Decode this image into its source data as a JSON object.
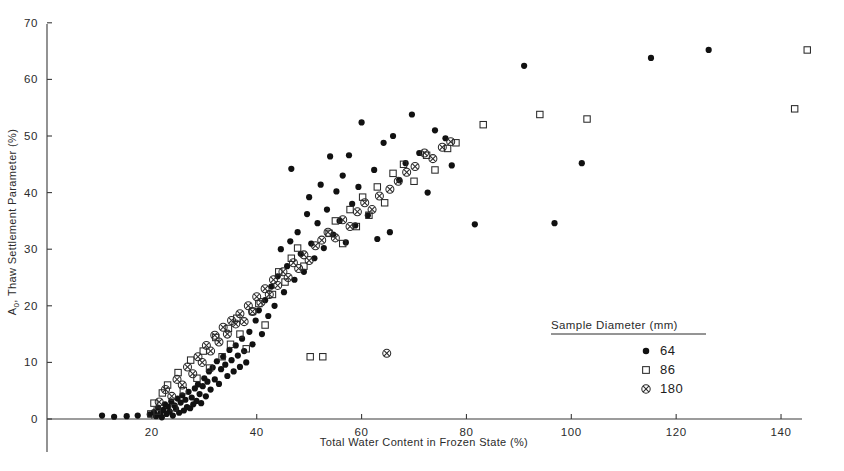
{
  "chart_data": {
    "type": "scatter",
    "title": "",
    "xlabel": "Total Water Content in Frozen State (%)",
    "ylabel": "A0, Thaw Settlement Parameter (%)",
    "ylabel_main": "A",
    "ylabel_sub": "0",
    "ylabel_rest": ", Thaw Settlement Parameter (%)",
    "xlim": [
      0,
      144
    ],
    "ylim": [
      0,
      70
    ],
    "xticks": [
      20,
      40,
      60,
      80,
      100,
      120,
      140
    ],
    "yticks": [
      0,
      10,
      20,
      30,
      40,
      50,
      60,
      70
    ],
    "xtick_labels": [
      "20",
      "40",
      "60",
      "80",
      "100",
      "120",
      "140"
    ],
    "ytick_labels": [
      "0",
      "10",
      "20",
      "30",
      "40",
      "50",
      "60",
      "70"
    ],
    "grid": false,
    "legend_position": "bottom-right",
    "legend": {
      "title": "Sample Diameter (mm)",
      "entries": [
        {
          "label": "64",
          "marker": "filled-circle"
        },
        {
          "label": "86",
          "marker": "open-square"
        },
        {
          "label": "180",
          "marker": "circled-cross"
        }
      ]
    },
    "series": [
      {
        "name": "64",
        "marker": "filled-circle",
        "color": "#111111",
        "points": [
          [
            10.5,
            0.6
          ],
          [
            12.8,
            0.4
          ],
          [
            15.2,
            0.5
          ],
          [
            17.3,
            0.6
          ],
          [
            19.6,
            0.8
          ],
          [
            20.4,
            1.2
          ],
          [
            20.8,
            0.5
          ],
          [
            21.2,
            2.0
          ],
          [
            21.6,
            1.0
          ],
          [
            21.9,
            0.3
          ],
          [
            22.2,
            1.6
          ],
          [
            22.5,
            2.6
          ],
          [
            22.8,
            0.9
          ],
          [
            23.1,
            2.2
          ],
          [
            23.4,
            1.3
          ],
          [
            23.7,
            3.1
          ],
          [
            24.0,
            0.6
          ],
          [
            24.3,
            2.4
          ],
          [
            24.6,
            1.8
          ],
          [
            24.9,
            3.6
          ],
          [
            25.2,
            1.1
          ],
          [
            25.5,
            2.9
          ],
          [
            25.8,
            4.2
          ],
          [
            26.1,
            1.5
          ],
          [
            26.4,
            3.4
          ],
          [
            26.7,
            2.1
          ],
          [
            27.0,
            4.8
          ],
          [
            27.3,
            1.9
          ],
          [
            27.6,
            3.8
          ],
          [
            27.9,
            2.6
          ],
          [
            28.2,
            5.4
          ],
          [
            28.5,
            3.2
          ],
          [
            28.8,
            6.1
          ],
          [
            29.1,
            4.4
          ],
          [
            29.4,
            2.8
          ],
          [
            29.7,
            5.8
          ],
          [
            30.0,
            7.2
          ],
          [
            30.3,
            4.0
          ],
          [
            30.6,
            6.6
          ],
          [
            30.9,
            8.4
          ],
          [
            31.2,
            5.2
          ],
          [
            31.6,
            9.1
          ],
          [
            32.0,
            7.0
          ],
          [
            32.4,
            10.2
          ],
          [
            32.8,
            6.2
          ],
          [
            33.2,
            8.8
          ],
          [
            33.6,
            11.0
          ],
          [
            34.0,
            9.6
          ],
          [
            34.4,
            7.6
          ],
          [
            34.8,
            12.2
          ],
          [
            35.2,
            10.4
          ],
          [
            35.6,
            8.4
          ],
          [
            36.0,
            13.0
          ],
          [
            36.4,
            11.2
          ],
          [
            36.8,
            9.2
          ],
          [
            37.2,
            14.2
          ],
          [
            37.6,
            12.0
          ],
          [
            38.0,
            10.0
          ],
          [
            38.6,
            15.4
          ],
          [
            39.2,
            13.2
          ],
          [
            39.8,
            17.4
          ],
          [
            40.4,
            19.2
          ],
          [
            41.0,
            15.0
          ],
          [
            41.6,
            21.0
          ],
          [
            42.2,
            18.2
          ],
          [
            42.8,
            23.4
          ],
          [
            43.4,
            20.0
          ],
          [
            44.0,
            25.2
          ],
          [
            44.6,
            30.0
          ],
          [
            45.2,
            22.4
          ],
          [
            45.8,
            27.0
          ],
          [
            46.4,
            31.4
          ],
          [
            46.6,
            44.2
          ],
          [
            47.2,
            24.6
          ],
          [
            47.8,
            33.0
          ],
          [
            48.4,
            29.2
          ],
          [
            49.0,
            26.0
          ],
          [
            49.6,
            36.2
          ],
          [
            50.0,
            39.2
          ],
          [
            50.4,
            31.0
          ],
          [
            51.0,
            28.4
          ],
          [
            51.6,
            34.6
          ],
          [
            52.2,
            41.4
          ],
          [
            52.8,
            30.2
          ],
          [
            53.4,
            37.0
          ],
          [
            54.0,
            46.4
          ],
          [
            54.6,
            32.6
          ],
          [
            55.2,
            40.2
          ],
          [
            55.8,
            35.0
          ],
          [
            56.4,
            43.0
          ],
          [
            57.0,
            31.2
          ],
          [
            57.6,
            46.6
          ],
          [
            58.2,
            38.0
          ],
          [
            58.8,
            34.2
          ],
          [
            59.4,
            41.0
          ],
          [
            60.0,
            52.4
          ],
          [
            61.2,
            36.0
          ],
          [
            62.4,
            44.0
          ],
          [
            63.0,
            31.8
          ],
          [
            64.2,
            48.8
          ],
          [
            65.4,
            33.0
          ],
          [
            66.0,
            50.0
          ],
          [
            67.2,
            42.2
          ],
          [
            68.4,
            45.2
          ],
          [
            69.6,
            53.8
          ],
          [
            71.0,
            47.0
          ],
          [
            72.6,
            40.0
          ],
          [
            74.0,
            51.0
          ],
          [
            76.0,
            49.6
          ],
          [
            77.2,
            44.8
          ],
          [
            81.6,
            34.4
          ],
          [
            91.0,
            62.4
          ],
          [
            96.8,
            34.6
          ],
          [
            102.0,
            45.2
          ],
          [
            115.2,
            63.8
          ],
          [
            126.2,
            65.2
          ]
        ]
      },
      {
        "name": "86",
        "marker": "open-square",
        "color": "#2a2a2a",
        "points": [
          [
            19.8,
            0.9
          ],
          [
            20.4,
            2.8
          ],
          [
            21.0,
            1.4
          ],
          [
            22.0,
            4.6
          ],
          [
            23.0,
            6.0
          ],
          [
            24.2,
            2.0
          ],
          [
            25.0,
            8.2
          ],
          [
            26.0,
            5.0
          ],
          [
            27.4,
            10.4
          ],
          [
            28.6,
            7.2
          ],
          [
            29.8,
            12.0
          ],
          [
            31.0,
            9.0
          ],
          [
            32.2,
            14.4
          ],
          [
            33.4,
            11.0
          ],
          [
            34.6,
            16.0
          ],
          [
            35.0,
            13.2
          ],
          [
            36.2,
            17.8
          ],
          [
            36.8,
            15.0
          ],
          [
            38.0,
            12.4
          ],
          [
            39.2,
            19.0
          ],
          [
            40.4,
            20.4
          ],
          [
            41.6,
            16.6
          ],
          [
            43.0,
            22.0
          ],
          [
            44.2,
            26.0
          ],
          [
            45.4,
            24.2
          ],
          [
            46.6,
            28.4
          ],
          [
            47.8,
            30.2
          ],
          [
            49.0,
            27.0
          ],
          [
            50.2,
            11.0
          ],
          [
            52.6,
            11.0
          ],
          [
            53.8,
            32.8
          ],
          [
            55.0,
            35.0
          ],
          [
            56.4,
            31.0
          ],
          [
            57.8,
            37.0
          ],
          [
            59.0,
            34.0
          ],
          [
            60.2,
            39.2
          ],
          [
            61.4,
            36.0
          ],
          [
            63.0,
            41.0
          ],
          [
            64.4,
            38.2
          ],
          [
            66.0,
            43.4
          ],
          [
            68.0,
            45.0
          ],
          [
            70.0,
            42.0
          ],
          [
            72.4,
            46.6
          ],
          [
            74.0,
            44.0
          ],
          [
            76.4,
            47.8
          ],
          [
            78.0,
            48.8
          ],
          [
            83.2,
            52.0
          ],
          [
            94.0,
            53.8
          ],
          [
            103.0,
            53.0
          ],
          [
            145.0,
            65.2
          ],
          [
            142.6,
            54.8
          ]
        ]
      },
      {
        "name": "180",
        "marker": "circled-cross",
        "color": "#2a2a2a",
        "points": [
          [
            21.4,
            3.0
          ],
          [
            22.6,
            5.2
          ],
          [
            23.8,
            4.0
          ],
          [
            24.8,
            7.0
          ],
          [
            25.8,
            6.0
          ],
          [
            26.8,
            9.2
          ],
          [
            27.8,
            8.0
          ],
          [
            28.8,
            11.0
          ],
          [
            29.6,
            10.0
          ],
          [
            30.4,
            13.0
          ],
          [
            31.2,
            12.0
          ],
          [
            32.0,
            14.8
          ],
          [
            32.8,
            13.6
          ],
          [
            33.6,
            16.2
          ],
          [
            34.4,
            15.0
          ],
          [
            35.2,
            17.4
          ],
          [
            36.0,
            16.8
          ],
          [
            36.8,
            18.6
          ],
          [
            37.6,
            17.2
          ],
          [
            38.4,
            20.0
          ],
          [
            39.2,
            19.0
          ],
          [
            40.0,
            21.6
          ],
          [
            40.8,
            20.6
          ],
          [
            41.6,
            23.0
          ],
          [
            42.4,
            22.0
          ],
          [
            43.2,
            24.6
          ],
          [
            44.0,
            23.6
          ],
          [
            45.0,
            26.0
          ],
          [
            46.0,
            25.0
          ],
          [
            47.0,
            27.6
          ],
          [
            48.0,
            26.6
          ],
          [
            49.0,
            29.0
          ],
          [
            50.0,
            28.0
          ],
          [
            51.2,
            30.6
          ],
          [
            52.4,
            31.6
          ],
          [
            53.6,
            33.0
          ],
          [
            55.0,
            32.0
          ],
          [
            56.4,
            35.2
          ],
          [
            57.8,
            34.0
          ],
          [
            59.2,
            36.6
          ],
          [
            60.6,
            38.2
          ],
          [
            62.0,
            37.0
          ],
          [
            63.4,
            39.4
          ],
          [
            64.8,
            11.6
          ],
          [
            65.4,
            40.6
          ],
          [
            67.0,
            42.0
          ],
          [
            68.6,
            43.6
          ],
          [
            70.2,
            44.6
          ],
          [
            72.0,
            47.0
          ],
          [
            73.6,
            46.0
          ],
          [
            75.4,
            48.0
          ],
          [
            77.0,
            49.0
          ]
        ]
      }
    ]
  }
}
